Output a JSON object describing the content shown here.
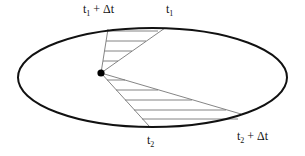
{
  "diagram": {
    "labels": {
      "t1_plus_dt": {
        "base": "t",
        "sub": "1",
        "suffix": " + Δt"
      },
      "t1": {
        "base": "t",
        "sub": "1",
        "suffix": ""
      },
      "t2": {
        "base": "t",
        "sub": "2",
        "suffix": ""
      },
      "t2_plus_dt": {
        "base": "t",
        "sub": "2",
        "suffix": " + Δt"
      }
    },
    "colors": {
      "ellipse": "#111111",
      "sector": "#777777",
      "focus": "#000000"
    },
    "ellipse": {
      "cx": 152.5,
      "cy": 77.5,
      "rx": 134.5,
      "ry": 49.5
    },
    "focus": {
      "x": 101,
      "y": 73
    },
    "sectors": [
      {
        "name": "upper",
        "points": [
          [
            108,
            29
          ],
          [
            165,
            28
          ]
        ]
      },
      {
        "name": "lower",
        "points": [
          [
            149,
            126
          ],
          [
            241,
            114
          ]
        ]
      }
    ]
  }
}
